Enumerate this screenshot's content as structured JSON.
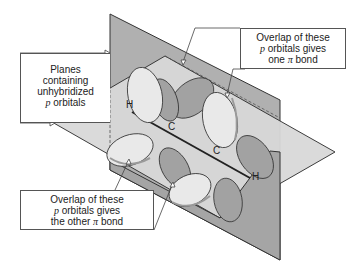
{
  "diagram": {
    "labels": {
      "planes": {
        "lines": [
          "Planes",
          "containing",
          "unhybridized"
        ],
        "last_line_italic": "p",
        "last_line_rest": " orbitals"
      },
      "top_overlap": {
        "line1": "Overlap of these",
        "line2_italic": "p",
        "line2_rest": " orbitals gives",
        "line3_pre": "one ",
        "line3_symbol": "π",
        "line3_post": " bond"
      },
      "bottom_overlap": {
        "line1": "Overlap of these",
        "line2_italic": "p",
        "line2_rest": " orbitals gives",
        "line3_pre": "the other ",
        "line3_symbol": "π",
        "line3_post": " bond"
      }
    },
    "atoms": {
      "h_left": "H",
      "c_left": "C",
      "c_right": "C",
      "h_right": "H"
    },
    "colors": {
      "vertical_plane": "#a9a9a9",
      "horizontal_plane": "#d6d6d6",
      "lobe_light": "#e8e8e8",
      "lobe_dark": "#9e9e9e",
      "lobe_rim": "#bdbdbd",
      "outline": "#333333"
    }
  }
}
